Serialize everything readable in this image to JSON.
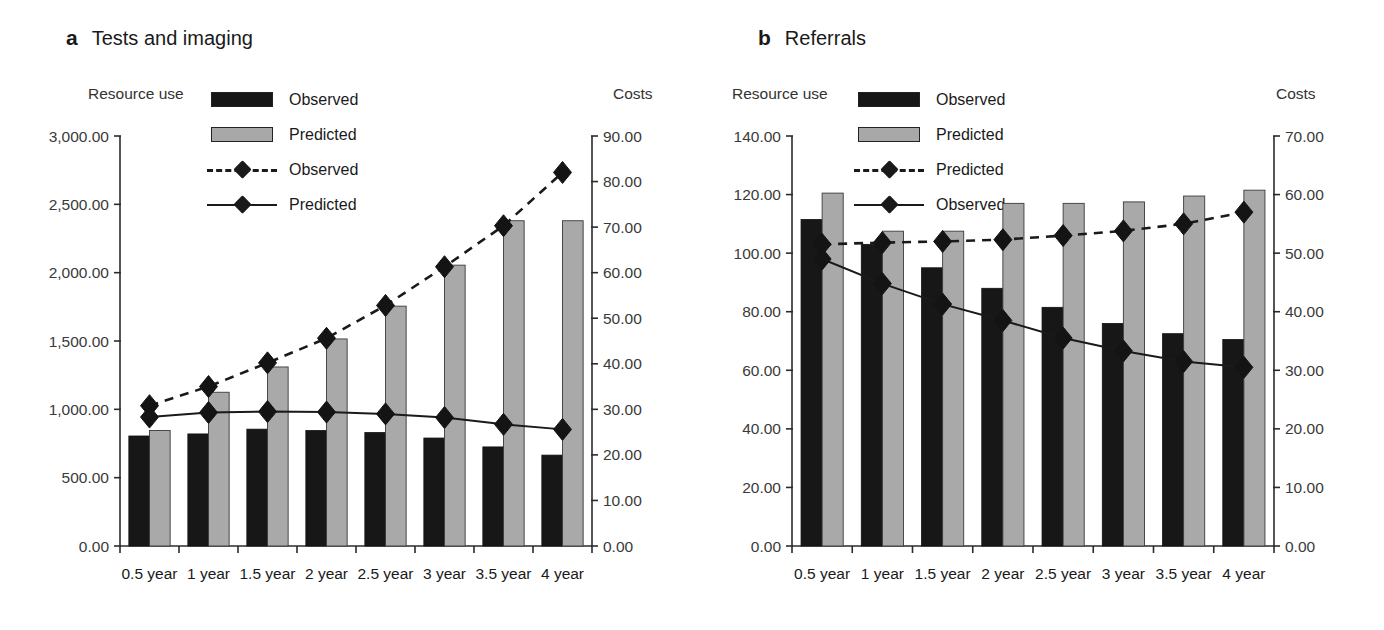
{
  "figure": {
    "width": 1384,
    "height": 630
  },
  "panels": [
    {
      "letter": "a",
      "title": "Tests and imaging",
      "left_axis_caption": "Resource use",
      "right_axis_caption": "Costs",
      "legend": [
        {
          "label": "Observed",
          "key": "bar-black"
        },
        {
          "label": "Predicted",
          "key": "bar-gray"
        },
        {
          "label": "Observed",
          "key": "line-dashed"
        },
        {
          "label": "Predicted",
          "key": "line-solid"
        }
      ],
      "chart_data": {
        "type": "bar",
        "title": "Tests and imaging",
        "xlabel": "",
        "ylabel": "Resource use",
        "y2label": "Costs",
        "categories": [
          "0.5 year",
          "1 year",
          "1.5 year",
          "2 year",
          "2.5 year",
          "3 year",
          "3.5 year",
          "4 year"
        ],
        "ylim": [
          0,
          3000
        ],
        "yticks": [
          "0.00",
          "500.00",
          "1,000.00",
          "1,500.00",
          "2,000.00",
          "2,500.00",
          "3,000.00"
        ],
        "y2lim": [
          0,
          90
        ],
        "y2ticks": [
          "0.00",
          "10.00",
          "20.00",
          "30.00",
          "40.00",
          "50.00",
          "60.00",
          "70.00",
          "80.00",
          "90.00"
        ],
        "grid": false,
        "legend_position": "top-center",
        "series": [
          {
            "name": "Observed",
            "kind": "bar",
            "axis": "left",
            "color": "#171717",
            "values": [
              805,
              820,
              855,
              845,
              830,
              790,
              725,
              665
            ]
          },
          {
            "name": "Predicted",
            "kind": "bar",
            "axis": "left",
            "color": "#a9a9a9",
            "values": [
              845,
              1125,
              1310,
              1515,
              1755,
              2055,
              2380,
              2380
            ]
          },
          {
            "name": "Observed",
            "kind": "line",
            "axis": "right",
            "style": "dashed",
            "values": [
              30.8,
              35.0,
              40.2,
              45.6,
              52.8,
              61.3,
              70.3,
              82.0
            ]
          },
          {
            "name": "Predicted",
            "kind": "line",
            "axis": "right",
            "style": "solid",
            "values": [
              28.3,
              29.3,
              29.5,
              29.4,
              29.0,
              28.2,
              26.7,
              25.6
            ]
          }
        ]
      }
    },
    {
      "letter": "b",
      "title": "Referrals",
      "left_axis_caption": "Resource use",
      "right_axis_caption": "Costs",
      "legend": [
        {
          "label": "Observed",
          "key": "bar-black"
        },
        {
          "label": "Predicted",
          "key": "bar-gray"
        },
        {
          "label": "Predicted",
          "key": "line-dashed"
        },
        {
          "label": "Observed",
          "key": "line-solid"
        }
      ],
      "chart_data": {
        "type": "bar",
        "title": "Referrals",
        "xlabel": "",
        "ylabel": "Resource use",
        "y2label": "Costs",
        "categories": [
          "0.5 year",
          "1 year",
          "1.5 year",
          "2 year",
          "2.5 year",
          "3 year",
          "3.5 year",
          "4 year"
        ],
        "ylim": [
          0,
          140
        ],
        "yticks": [
          "0.00",
          "20.00",
          "40.00",
          "60.00",
          "80.00",
          "100.00",
          "120.00",
          "140.00"
        ],
        "y2lim": [
          0,
          70
        ],
        "y2ticks": [
          "0.00",
          "10.00",
          "20.00",
          "30.00",
          "40.00",
          "50.00",
          "60.00",
          "70.00"
        ],
        "grid": false,
        "legend_position": "top-center",
        "series": [
          {
            "name": "Observed",
            "kind": "bar",
            "axis": "left",
            "color": "#171717",
            "values": [
              111.5,
              103.0,
              95.0,
              88.0,
              81.5,
              76.0,
              72.5,
              70.5
            ]
          },
          {
            "name": "Predicted",
            "kind": "bar",
            "axis": "left",
            "color": "#a9a9a9",
            "values": [
              120.5,
              107.5,
              107.5,
              117.0,
              117.0,
              117.5,
              119.5,
              121.5
            ]
          },
          {
            "name": "Predicted",
            "kind": "line",
            "axis": "right",
            "style": "dashed",
            "values": [
              51.5,
              51.8,
              52.0,
              52.3,
              53.0,
              53.8,
              55.0,
              57.0
            ]
          },
          {
            "name": "Observed",
            "kind": "line",
            "axis": "right",
            "style": "solid",
            "values": [
              49.0,
              44.8,
              41.3,
              38.5,
              35.5,
              33.3,
              31.5,
              30.5
            ]
          }
        ]
      }
    }
  ]
}
